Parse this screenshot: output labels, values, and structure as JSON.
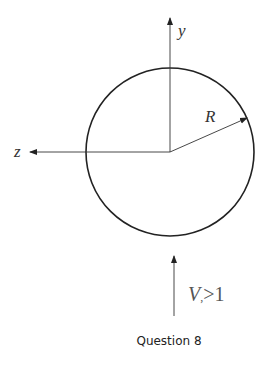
{
  "diagram": {
    "axis_y_label": "y",
    "axis_z_label": "z",
    "radius_label": "R",
    "velocity_label_var": "V",
    "velocity_label_sub": ",",
    "velocity_label_cond": ">1",
    "caption": "Question 8",
    "colors": {
      "stroke": "#222222",
      "text": "#333333",
      "background": "#ffffff"
    }
  }
}
